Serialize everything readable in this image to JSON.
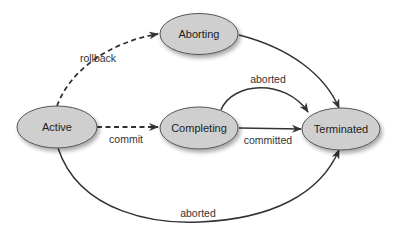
{
  "diagram": {
    "type": "state-machine",
    "colors": {
      "node_fill": "#cfcfcf",
      "node_stroke": "#555555",
      "edge": "#333333",
      "text": "#222222"
    },
    "nodes": {
      "active": {
        "label": "Active",
        "cx": 57,
        "cy": 127
      },
      "aborting": {
        "label": "Aborting",
        "cx": 199,
        "cy": 34
      },
      "completing": {
        "label": "Completing",
        "cx": 199,
        "cy": 128
      },
      "terminated": {
        "label": "Terminated",
        "cx": 341,
        "cy": 129
      }
    },
    "edges": {
      "rollback": {
        "from": "Active",
        "to": "Aborting",
        "label": "rollback",
        "style": "dashed"
      },
      "commit": {
        "from": "Active",
        "to": "Completing",
        "label": "commit",
        "style": "dashed"
      },
      "aborting_terminated": {
        "from": "Aborting",
        "to": "Terminated",
        "label": "",
        "style": "solid"
      },
      "completing_aborted": {
        "from": "Completing",
        "to": "Terminated",
        "label": "aborted",
        "style": "solid"
      },
      "completing_committed": {
        "from": "Completing",
        "to": "Terminated",
        "label": "committed",
        "style": "solid"
      },
      "active_aborted": {
        "from": "Active",
        "to": "Terminated",
        "label": "aborted",
        "style": "solid"
      }
    }
  }
}
